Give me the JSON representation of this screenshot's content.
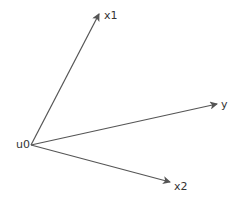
{
  "diagram": {
    "type": "vector-diagram",
    "origin": {
      "label": "u0",
      "x": 31,
      "y": 145
    },
    "vectors": [
      {
        "label": "x1",
        "tip": {
          "x": 99,
          "y": 14
        }
      },
      {
        "label": "y",
        "tip": {
          "x": 217,
          "y": 104
        }
      },
      {
        "label": "x2",
        "tip": {
          "x": 170,
          "y": 182
        }
      }
    ],
    "stroke_color": "#555555"
  }
}
